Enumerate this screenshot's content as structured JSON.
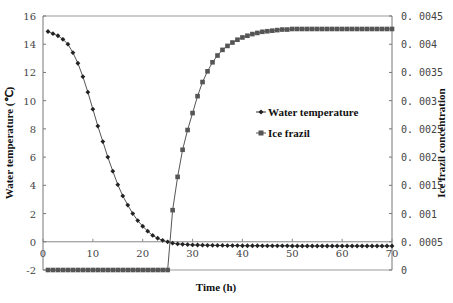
{
  "chart_data": {
    "type": "line",
    "title": "",
    "xlabel": "Time (h)",
    "ylabel": "Water temperature (℃)",
    "y2label": "Ice frazil concentration",
    "xlim": [
      0,
      70
    ],
    "ylim": [
      -2,
      16
    ],
    "y2lim": [
      0,
      0.0045
    ],
    "xticks": [
      0,
      10,
      20,
      30,
      40,
      50,
      60,
      70
    ],
    "yticks": [
      -2,
      0,
      2,
      4,
      6,
      8,
      10,
      12,
      14,
      16
    ],
    "y2ticks": [
      "0",
      "0.0005",
      "0.001",
      "0.0015",
      "0.002",
      "0.0025",
      "0.003",
      "0.0035",
      "0.004",
      "0.0045"
    ],
    "grid": false,
    "legend_position": "center-right inside plot",
    "series": [
      {
        "name": "Water temperature",
        "axis": "left",
        "marker": "diamond",
        "x": [
          1,
          2,
          3,
          4,
          5,
          6,
          7,
          8,
          9,
          10,
          11,
          12,
          13,
          14,
          15,
          16,
          17,
          18,
          19,
          20,
          21,
          22,
          23,
          24,
          25,
          26,
          27,
          28,
          29,
          30,
          31,
          32,
          33,
          34,
          35,
          36,
          37,
          38,
          39,
          40,
          41,
          42,
          43,
          44,
          45,
          46,
          47,
          48,
          49,
          50,
          51,
          52,
          53,
          54,
          55,
          56,
          57,
          58,
          59,
          60,
          61,
          62,
          63,
          64,
          65,
          66,
          67,
          68,
          69,
          70
        ],
        "values": [
          14.9,
          14.75,
          14.6,
          14.35,
          14.0,
          13.4,
          12.65,
          11.7,
          10.6,
          9.4,
          8.2,
          7.1,
          6.0,
          5.0,
          4.05,
          3.25,
          2.6,
          2.0,
          1.5,
          1.1,
          0.75,
          0.45,
          0.25,
          0.1,
          0.0,
          -0.1,
          -0.15,
          -0.18,
          -0.2,
          -0.22,
          -0.23,
          -0.24,
          -0.25,
          -0.25,
          -0.26,
          -0.26,
          -0.27,
          -0.27,
          -0.27,
          -0.28,
          -0.28,
          -0.28,
          -0.28,
          -0.29,
          -0.29,
          -0.29,
          -0.29,
          -0.29,
          -0.29,
          -0.3,
          -0.3,
          -0.3,
          -0.3,
          -0.3,
          -0.3,
          -0.3,
          -0.3,
          -0.3,
          -0.3,
          -0.3,
          -0.3,
          -0.3,
          -0.3,
          -0.3,
          -0.3,
          -0.3,
          -0.3,
          -0.3,
          -0.3,
          -0.3
        ]
      },
      {
        "name": "Ice frazil",
        "axis": "right",
        "marker": "square",
        "x": [
          1,
          2,
          3,
          4,
          5,
          6,
          7,
          8,
          9,
          10,
          11,
          12,
          13,
          14,
          15,
          16,
          17,
          18,
          19,
          20,
          21,
          22,
          23,
          24,
          25,
          26,
          27,
          28,
          29,
          30,
          31,
          32,
          33,
          34,
          35,
          36,
          37,
          38,
          39,
          40,
          41,
          42,
          43,
          44,
          45,
          46,
          47,
          48,
          49,
          50,
          51,
          52,
          53,
          54,
          55,
          56,
          57,
          58,
          59,
          60,
          61,
          62,
          63,
          64,
          65,
          66,
          67,
          68,
          69,
          70
        ],
        "values": [
          0,
          0,
          0,
          0,
          0,
          0,
          0,
          0,
          0,
          0,
          0,
          0,
          0,
          0,
          0,
          0,
          0,
          0,
          0,
          0,
          0,
          0,
          0,
          0,
          0,
          0.00106,
          0.00165,
          0.00213,
          0.00248,
          0.00278,
          0.00308,
          0.00333,
          0.00352,
          0.00368,
          0.0038,
          0.0039,
          0.00397,
          0.00403,
          0.00408,
          0.00412,
          0.00415,
          0.00418,
          0.0042,
          0.00422,
          0.00423,
          0.00424,
          0.00425,
          0.00426,
          0.00426,
          0.00427,
          0.00427,
          0.00427,
          0.00427,
          0.00427,
          0.00427,
          0.00427,
          0.00427,
          0.00427,
          0.00427,
          0.00427,
          0.00427,
          0.00427,
          0.00427,
          0.00427,
          0.00427,
          0.00427,
          0.00427,
          0.00427,
          0.00427,
          0.00427
        ]
      }
    ]
  },
  "legend": {
    "items": [
      {
        "label": "Water temperature"
      },
      {
        "label": "Ice frazil"
      }
    ]
  },
  "colors": {
    "line": "#555555",
    "marker": "#222222",
    "square_marker": "#555555",
    "axis": "#777777"
  }
}
